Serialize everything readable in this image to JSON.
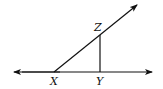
{
  "diagram": {
    "type": "geometry",
    "points": {
      "X": {
        "label": "X",
        "x": 54,
        "y": 72
      },
      "Y": {
        "label": "Y",
        "x": 100,
        "y": 72
      },
      "Z": {
        "label": "Z",
        "x": 100,
        "y": 34
      }
    },
    "elements": [
      {
        "kind": "line",
        "through": [
          "X",
          "Y"
        ],
        "arrows": "both"
      },
      {
        "kind": "ray",
        "from": "X",
        "through": "Z",
        "arrows": "end"
      },
      {
        "kind": "segment",
        "from": "Z",
        "to": "Y"
      }
    ],
    "colors": {
      "stroke": "#111111",
      "background": "#ffffff"
    }
  }
}
